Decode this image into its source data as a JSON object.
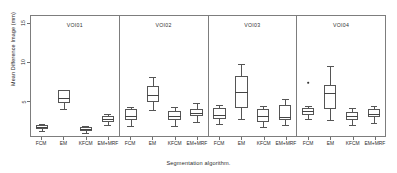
{
  "chart_data": {
    "type": "box",
    "title": "",
    "xlabel": "Segmentation algorithm.",
    "ylabel": "Mean Difference Image (mm)",
    "ylim": [
      0.6,
      16.2
    ],
    "yticks": [
      5,
      10,
      15
    ],
    "ytick_labels": [
      "5",
      "10",
      "15"
    ],
    "grid": false,
    "legend": "none",
    "categories": [
      "FCM",
      "EM",
      "KFCM",
      "EM+MRF"
    ],
    "panels": [
      {
        "label": "VOI01",
        "boxes": [
          {
            "category": "FCM",
            "min": 1.55,
            "q1": 1.8,
            "median": 2.0,
            "q3": 2.25,
            "max": 2.45,
            "outliers": []
          },
          {
            "category": "EM",
            "min": 4.25,
            "q1": 5.05,
            "median": 5.7,
            "q3": 6.7,
            "max": 6.75,
            "outliers": []
          },
          {
            "category": "KFCM",
            "min": 1.3,
            "q1": 1.55,
            "median": 1.7,
            "q3": 1.95,
            "max": 2.15,
            "outliers": []
          },
          {
            "category": "EM+MRF",
            "min": 2.25,
            "q1": 2.7,
            "median": 3.05,
            "q3": 3.35,
            "max": 3.7,
            "outliers": []
          }
        ]
      },
      {
        "label": "VOI02",
        "boxes": [
          {
            "category": "FCM",
            "min": 2.1,
            "q1": 2.95,
            "median": 3.45,
            "q3": 4.35,
            "max": 4.55,
            "outliers": []
          },
          {
            "category": "EM",
            "min": 4.2,
            "q1": 5.25,
            "median": 6.1,
            "q3": 7.2,
            "max": 8.35,
            "outliers": []
          },
          {
            "category": "KFCM",
            "min": 2.15,
            "q1": 2.9,
            "median": 3.35,
            "q3": 4.0,
            "max": 4.6,
            "outliers": []
          },
          {
            "category": "EM+MRF",
            "min": 2.65,
            "q1": 3.35,
            "median": 3.8,
            "q3": 4.35,
            "max": 5.05,
            "outliers": []
          }
        ]
      },
      {
        "label": "VOI03",
        "boxes": [
          {
            "category": "FCM",
            "min": 2.35,
            "q1": 3.05,
            "median": 3.6,
            "q3": 4.4,
            "max": 4.85,
            "outliers": []
          },
          {
            "category": "EM",
            "min": 3.05,
            "q1": 4.45,
            "median": 6.45,
            "q3": 8.55,
            "max": 10.0,
            "outliers": []
          },
          {
            "category": "KFCM",
            "min": 1.95,
            "q1": 2.65,
            "median": 3.35,
            "q3": 4.3,
            "max": 4.75,
            "outliers": []
          },
          {
            "category": "EM+MRF",
            "min": 2.3,
            "q1": 2.95,
            "median": 3.25,
            "q3": 4.85,
            "max": 5.55,
            "outliers": []
          }
        ]
      },
      {
        "label": "VOI04",
        "boxes": [
          {
            "category": "FCM",
            "min": 3.05,
            "q1": 3.55,
            "median": 4.05,
            "q3": 4.45,
            "max": 4.7,
            "outliers": [
              7.85
            ]
          },
          {
            "category": "EM",
            "min": 2.95,
            "q1": 4.35,
            "median": 6.3,
            "q3": 7.4,
            "max": 9.75,
            "outliers": []
          },
          {
            "category": "KFCM",
            "min": 2.25,
            "q1": 2.9,
            "median": 3.35,
            "q3": 3.95,
            "max": 4.45,
            "outliers": []
          },
          {
            "category": "EM+MRF",
            "min": 2.55,
            "q1": 3.25,
            "median": 3.7,
            "q3": 4.25,
            "max": 4.7,
            "outliers": []
          }
        ]
      }
    ]
  }
}
